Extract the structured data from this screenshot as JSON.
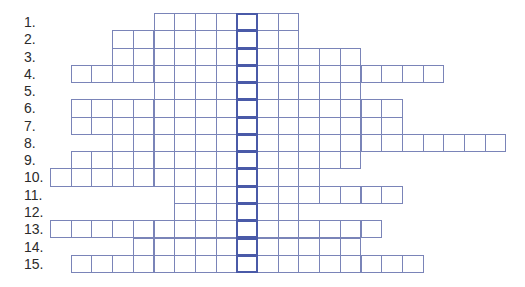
{
  "puzzle": {
    "type": "crossword-keyword",
    "cell_width": 20.7,
    "row_height": 17.27,
    "origin_x": 50,
    "origin_y": 13,
    "key_column": 9,
    "colors": {
      "grid_line": "#7a84b8",
      "key_column_border": "#4a5aa8",
      "label": "#2b2b2b"
    },
    "rows": [
      {
        "label": "1.",
        "start_col": 5,
        "length": 7
      },
      {
        "label": "2.",
        "start_col": 3,
        "length": 9
      },
      {
        "label": "3.",
        "start_col": 3,
        "length": 12
      },
      {
        "label": "4.",
        "start_col": 1,
        "length": 18
      },
      {
        "label": "5.",
        "start_col": 5,
        "length": 10
      },
      {
        "label": "6.",
        "start_col": 1,
        "length": 16
      },
      {
        "label": "7.",
        "start_col": 1,
        "length": 16
      },
      {
        "label": "8.",
        "start_col": 3,
        "length": 19
      },
      {
        "label": "9.",
        "start_col": 1,
        "length": 14
      },
      {
        "label": "10.",
        "start_col": 0,
        "length": 13
      },
      {
        "label": "11.",
        "start_col": 6,
        "length": 11
      },
      {
        "label": "12.",
        "start_col": 6,
        "length": 6
      },
      {
        "label": "13.",
        "start_col": 0,
        "length": 16
      },
      {
        "label": "14.",
        "start_col": 4,
        "length": 11
      },
      {
        "label": "15.",
        "start_col": 1,
        "length": 17
      }
    ]
  }
}
